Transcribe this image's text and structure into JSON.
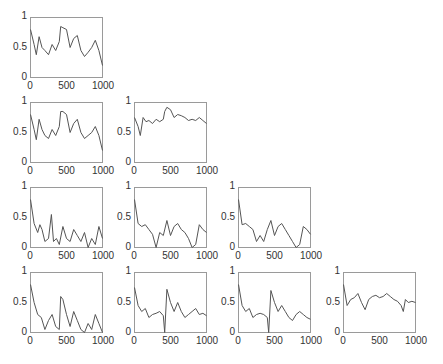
{
  "chart_data": {
    "type": "line",
    "layout": "lower-triangular 4x4 grid of subplots",
    "grid": false,
    "legend": null,
    "xlim": [
      0,
      1000
    ],
    "ylim": [
      0,
      1
    ],
    "xticks": [
      "0",
      "500",
      "1000"
    ],
    "yticks": [
      "0",
      "0.5",
      "1"
    ],
    "line_color": "#555555",
    "subplots": [
      {
        "row": 1,
        "col": 1,
        "x": [
          0,
          50,
          80,
          120,
          160,
          200,
          250,
          300,
          350,
          400,
          420,
          450,
          500,
          550,
          600,
          650,
          700,
          750,
          800,
          850,
          900,
          950,
          1000
        ],
        "values": [
          0.8,
          0.55,
          0.38,
          0.68,
          0.5,
          0.45,
          0.38,
          0.55,
          0.45,
          0.6,
          0.85,
          0.83,
          0.8,
          0.5,
          0.65,
          0.7,
          0.45,
          0.35,
          0.42,
          0.5,
          0.62,
          0.45,
          0.2
        ]
      },
      {
        "row": 2,
        "col": 1,
        "x": [
          0,
          50,
          80,
          120,
          160,
          200,
          250,
          300,
          350,
          400,
          420,
          450,
          500,
          550,
          600,
          650,
          700,
          750,
          800,
          850,
          900,
          950,
          1000
        ],
        "values": [
          0.8,
          0.55,
          0.38,
          0.72,
          0.55,
          0.45,
          0.4,
          0.55,
          0.45,
          0.6,
          0.85,
          0.85,
          0.8,
          0.5,
          0.65,
          0.72,
          0.5,
          0.4,
          0.45,
          0.5,
          0.6,
          0.45,
          0.2
        ]
      },
      {
        "row": 2,
        "col": 2,
        "x": [
          0,
          50,
          80,
          120,
          160,
          200,
          250,
          300,
          350,
          400,
          420,
          450,
          500,
          550,
          600,
          650,
          700,
          750,
          800,
          850,
          900,
          950,
          1000
        ],
        "values": [
          0.75,
          0.6,
          0.45,
          0.75,
          0.68,
          0.7,
          0.65,
          0.72,
          0.68,
          0.72,
          0.85,
          0.92,
          0.88,
          0.75,
          0.8,
          0.78,
          0.75,
          0.7,
          0.72,
          0.7,
          0.75,
          0.7,
          0.65
        ]
      },
      {
        "row": 3,
        "col": 1,
        "x": [
          0,
          50,
          100,
          130,
          160,
          200,
          250,
          290,
          320,
          360,
          400,
          450,
          500,
          550,
          600,
          650,
          700,
          750,
          800,
          850,
          900,
          950,
          1000
        ],
        "values": [
          0.8,
          0.4,
          0.25,
          0.38,
          0.3,
          0.1,
          0.15,
          0.55,
          0.1,
          0.15,
          0.05,
          0.35,
          0.15,
          0.1,
          0.3,
          0.2,
          0.1,
          0.25,
          0.0,
          0.15,
          0.05,
          0.35,
          0.15
        ]
      },
      {
        "row": 3,
        "col": 2,
        "x": [
          0,
          50,
          100,
          150,
          200,
          250,
          300,
          350,
          400,
          450,
          500,
          550,
          600,
          650,
          700,
          750,
          800,
          850,
          900,
          950,
          1000
        ],
        "values": [
          0.8,
          0.4,
          0.35,
          0.38,
          0.3,
          0.22,
          0.0,
          0.25,
          0.2,
          0.45,
          0.2,
          0.35,
          0.4,
          0.3,
          0.25,
          0.15,
          0.0,
          0.05,
          0.38,
          0.3,
          0.25
        ]
      },
      {
        "row": 3,
        "col": 3,
        "x": [
          0,
          50,
          100,
          150,
          200,
          250,
          300,
          350,
          400,
          450,
          500,
          550,
          600,
          650,
          700,
          750,
          800,
          850,
          900,
          950,
          1000
        ],
        "values": [
          0.8,
          0.38,
          0.4,
          0.35,
          0.3,
          0.1,
          0.2,
          0.1,
          0.3,
          0.45,
          0.2,
          0.35,
          0.4,
          0.3,
          0.2,
          0.1,
          0.0,
          0.05,
          0.35,
          0.3,
          0.22
        ]
      },
      {
        "row": 4,
        "col": 1,
        "x": [
          0,
          50,
          100,
          150,
          200,
          250,
          300,
          350,
          400,
          420,
          450,
          500,
          550,
          600,
          650,
          700,
          750,
          800,
          850,
          900,
          950,
          1000
        ],
        "values": [
          0.8,
          0.5,
          0.3,
          0.25,
          0.05,
          0.2,
          0.3,
          0.1,
          0.05,
          0.6,
          0.55,
          0.3,
          0.1,
          0.35,
          0.2,
          0.05,
          0.0,
          0.15,
          0.05,
          0.3,
          0.15,
          0.0
        ]
      },
      {
        "row": 4,
        "col": 2,
        "x": [
          0,
          50,
          100,
          150,
          200,
          250,
          300,
          350,
          400,
          420,
          450,
          500,
          550,
          600,
          650,
          700,
          750,
          800,
          850,
          900,
          950,
          1000
        ],
        "values": [
          0.75,
          0.45,
          0.35,
          0.4,
          0.25,
          0.3,
          0.32,
          0.35,
          0.28,
          0.0,
          0.72,
          0.5,
          0.35,
          0.5,
          0.35,
          0.25,
          0.3,
          0.35,
          0.4,
          0.3,
          0.32,
          0.28
        ]
      },
      {
        "row": 4,
        "col": 3,
        "x": [
          0,
          50,
          100,
          150,
          200,
          250,
          300,
          350,
          400,
          420,
          450,
          500,
          550,
          600,
          650,
          700,
          750,
          800,
          850,
          900,
          950,
          1000
        ],
        "values": [
          0.8,
          0.45,
          0.35,
          0.4,
          0.25,
          0.3,
          0.32,
          0.3,
          0.25,
          0.0,
          0.7,
          0.5,
          0.35,
          0.45,
          0.35,
          0.25,
          0.2,
          0.3,
          0.35,
          0.3,
          0.25,
          0.22
        ]
      },
      {
        "row": 4,
        "col": 4,
        "x": [
          0,
          50,
          100,
          150,
          200,
          250,
          300,
          350,
          400,
          450,
          500,
          550,
          600,
          650,
          700,
          750,
          800,
          830,
          860,
          900,
          950,
          1000
        ],
        "values": [
          0.8,
          0.45,
          0.55,
          0.58,
          0.65,
          0.5,
          0.38,
          0.55,
          0.6,
          0.62,
          0.58,
          0.6,
          0.65,
          0.6,
          0.55,
          0.52,
          0.45,
          0.35,
          0.55,
          0.5,
          0.52,
          0.5
        ]
      }
    ]
  }
}
